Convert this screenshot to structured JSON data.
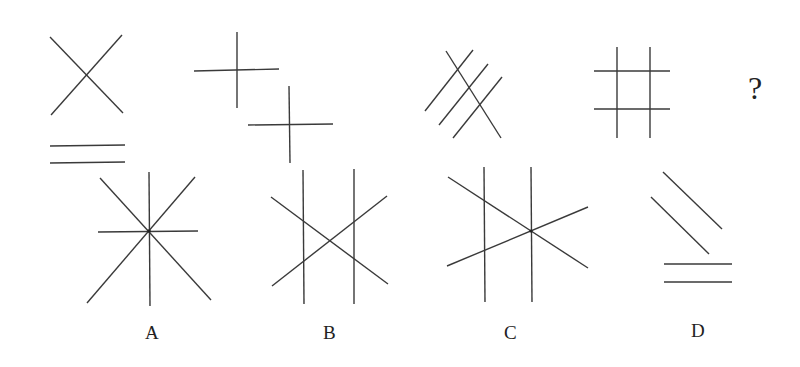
{
  "puzzle": {
    "question_mark": "?",
    "sequence": [
      {
        "id": "fig1",
        "description": "X shape above two horizontal parallel lines"
      },
      {
        "id": "fig2",
        "description": "Two plus signs offset diagonally"
      },
      {
        "id": "fig3",
        "description": "Three parallel diagonal lines crossed by one diagonal line"
      },
      {
        "id": "fig4",
        "description": "Hash / grid of two vertical and two horizontal lines"
      },
      {
        "id": "fig5",
        "description": "Unknown (question mark)"
      }
    ],
    "options": [
      {
        "label": "A",
        "description": "Eight-ray star: vertical, horizontal and two diagonals through one point"
      },
      {
        "label": "B",
        "description": "Two vertical lines crossed by an X"
      },
      {
        "label": "C",
        "description": "Two vertical lines with two lines crossing at the right vertical"
      },
      {
        "label": "D",
        "description": "Two parallel diagonal lines above two horizontal parallel lines"
      }
    ]
  },
  "colors": {
    "line": "#3a3a3a",
    "background": "#ffffff"
  }
}
